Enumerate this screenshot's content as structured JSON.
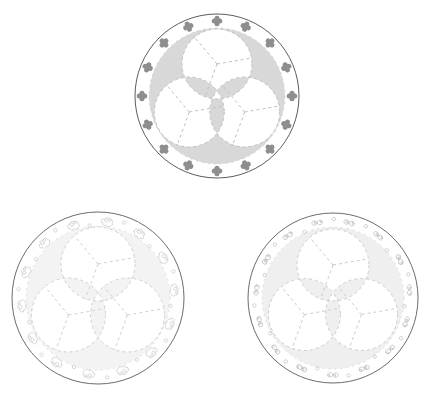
{
  "canvas": {
    "width": 430,
    "height": 401,
    "background_color": "#ffffff",
    "title": "Three circular trefoil medallion designs"
  },
  "palette": {
    "outline": "#4a4a4a",
    "dashed_guide": "#bdbdbd",
    "shade_dark": "#d8d8d8",
    "shade_light": "#eeeeee",
    "shade_faint": "#f3f3f3",
    "motif_dark": "#8e8e8e",
    "motif_mid": "#bcbcbc",
    "motif_light": "#cfcfcf"
  },
  "plates": [
    {
      "id": "plate-top",
      "name": "top-medallion",
      "label": "Top medallion",
      "center_x": 217,
      "center_y": 96,
      "outer_radius": 82,
      "inner_guide_radius": 68,
      "lobe_radius": 35,
      "lobe_offset": 32,
      "lobe_count": 3,
      "motif_name": "four-petal-floret",
      "motif_count": 16,
      "motif_ring_radius": 75,
      "motif_color": "#8e8e8e",
      "motif_size": 6.0,
      "shade_color": "#d8d8d8",
      "outline_color": "#4a4a4a",
      "outline_width": 0.9,
      "dash_color": "#c0c0c0"
    },
    {
      "id": "plate-bottom-left",
      "name": "bottom-left-medallion",
      "label": "Bottom left medallion",
      "center_x": 98,
      "center_y": 298,
      "outer_radius": 86,
      "inner_guide_radius": 72,
      "lobe_radius": 37,
      "lobe_offset": 34,
      "lobe_count": 3,
      "motif_name": "scroll-cloud-curl",
      "motif_count": 14,
      "motif_ring_radius": 78,
      "motif_color": "#cfcfcf",
      "motif_size": 9.5,
      "shade_color": "#f3f3f3",
      "outline_color": "#5a5a5a",
      "outline_width": 0.9,
      "dash_color": "#cfcfcf"
    },
    {
      "id": "plate-bottom-right",
      "name": "bottom-right-medallion",
      "label": "Bottom right medallion",
      "center_x": 333,
      "center_y": 298,
      "outer_radius": 85,
      "inner_guide_radius": 71,
      "lobe_radius": 36,
      "lobe_offset": 33,
      "lobe_count": 3,
      "motif_name": "figure-eight-knot",
      "motif_count": 15,
      "motif_ring_radius": 77,
      "motif_color": "#c6c6c6",
      "motif_size": 9.0,
      "shade_color": "#efefef",
      "outline_color": "#5a5a5a",
      "outline_width": 0.9,
      "dash_color": "#cbcbcb"
    }
  ]
}
